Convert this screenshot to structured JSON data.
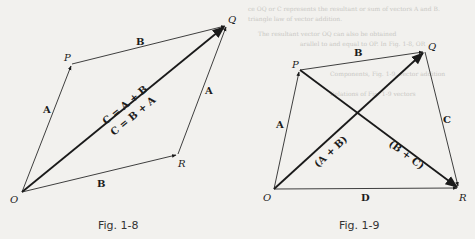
{
  "figures": [
    {
      "caption": "Fig. 1-8",
      "points": {
        "O": "O",
        "P": "P",
        "Q": "Q",
        "R": "R"
      },
      "vectors": [
        {
          "id": "OP",
          "label": "A"
        },
        {
          "id": "PQ",
          "label": "B"
        },
        {
          "id": "OR",
          "label": "B"
        },
        {
          "id": "RQ",
          "label": "A"
        },
        {
          "id": "OQ",
          "label_top": "C = A + B",
          "label_bottom": "C = B + A"
        }
      ]
    },
    {
      "caption": "Fig. 1-9",
      "points": {
        "O": "O",
        "P": "P",
        "Q": "Q",
        "R": "R"
      },
      "vectors": [
        {
          "id": "OP",
          "label": "A"
        },
        {
          "id": "PQ",
          "label": "B"
        },
        {
          "id": "QR",
          "label": "C"
        },
        {
          "id": "OR",
          "label": "D"
        },
        {
          "id": "OQ",
          "label": "(A + B)"
        },
        {
          "id": "PR",
          "label": "(B + C)"
        }
      ]
    }
  ],
  "background_text": [
    "ce OQ or C represents the resultant or sum of vectors A and B.",
    "triangle law of vector addition.",
    "The resultant vector OQ can also be obtained",
    "arallel to and equal to OP. In Fig. 1-8, OR",
    "Components, Fig. 1-9, vector addition",
    "Relations of Fig. 1-9 vectors"
  ]
}
